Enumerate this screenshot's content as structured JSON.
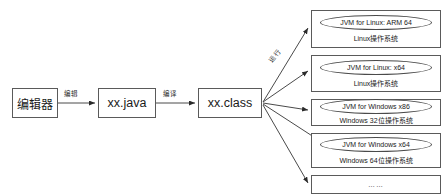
{
  "diagram": {
    "pipeline": [
      {
        "id": "editor",
        "label": "编辑器"
      },
      {
        "id": "java-source",
        "label": "xx.java"
      },
      {
        "id": "class-file",
        "label": "xx.class"
      }
    ],
    "edge_labels": {
      "edit": "编辑",
      "compile": "编译",
      "run": "运行"
    },
    "platforms": [
      {
        "jvm": "JVM for Linux: ARM 64",
        "os": "Linux操作系统"
      },
      {
        "jvm": "JVM for Linux: x64",
        "os": "Linux操作系统"
      },
      {
        "jvm": "JVM for Windows x86",
        "os": "Windows 32位操作系统"
      },
      {
        "jvm": "JVM for Windows x64",
        "os": "Windows 64位操作系统"
      },
      {
        "ellipsis": "……"
      }
    ],
    "colors": {
      "stroke": "#5a5a5a",
      "text": "#1a1a1a",
      "background": "#ffffff"
    }
  }
}
